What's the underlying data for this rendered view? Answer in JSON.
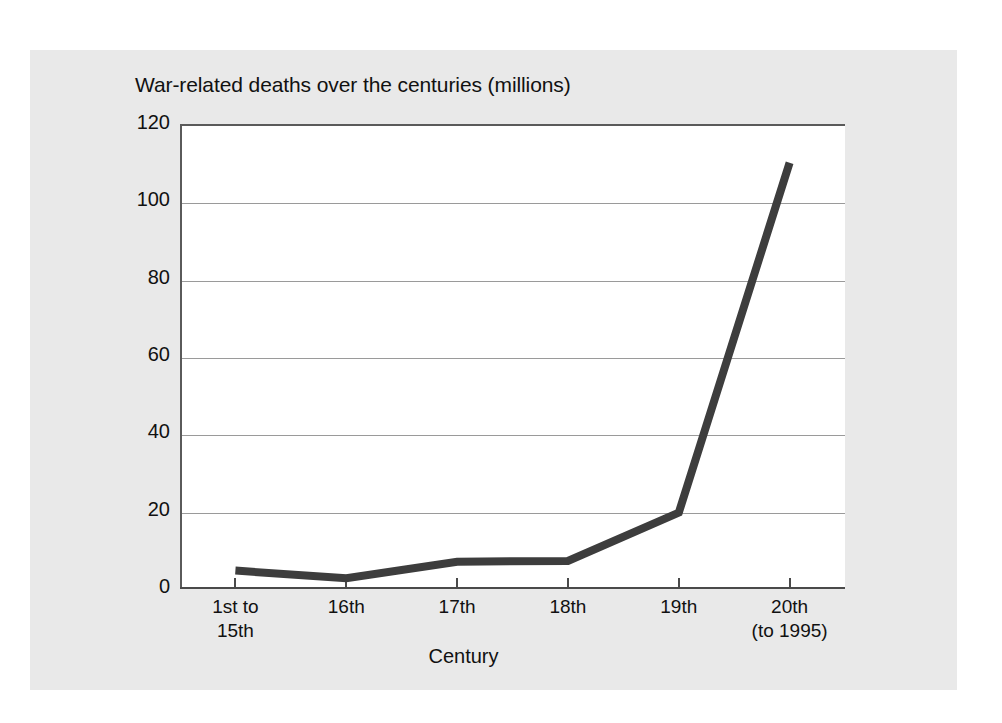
{
  "chart_data": {
    "type": "line",
    "title": "War-related deaths over the centuries (millions)",
    "xlabel": "Century",
    "ylabel": "",
    "categories": [
      "1st to\n15th",
      "16th",
      "17th",
      "18th",
      "19th",
      "20th\n(to 1995)"
    ],
    "values": [
      4.5,
      2.5,
      6.8,
      7,
      19.5,
      110
    ],
    "ylim": [
      0,
      120
    ],
    "yticks": [
      0,
      20,
      40,
      60,
      80,
      100,
      120
    ],
    "ytick_labels": [
      "0",
      "20",
      "40",
      "60",
      "80",
      "100",
      "120"
    ],
    "grid": true,
    "legend": "none",
    "series_name": "War-related deaths (millions)"
  },
  "colors": {
    "line": "#3d3d3d",
    "panel_background": "#e9e9e9",
    "plot_background": "#ffffff",
    "gridline": "#9a9a9a",
    "axis": "#4a4a4a",
    "text": "#111111"
  }
}
